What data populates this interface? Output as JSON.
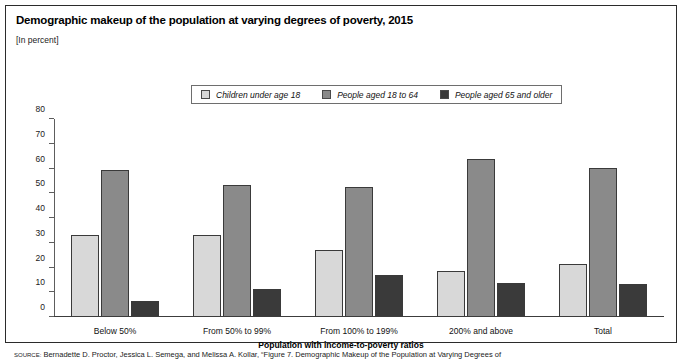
{
  "title": "Demographic makeup of the population at varying degrees of poverty, 2015",
  "units": "[In percent]",
  "source": {
    "prefix": "SOURCE:",
    "text": "Bernadette D. Proctor, Jessica L. Semega, and Melissa A. Kollar, “Figure 7. Demographic Makeup of the Population at Varying Degrees of"
  },
  "legend": [
    {
      "label": "Children under age 18",
      "color": "#d8d8d8"
    },
    {
      "label": "People aged 18 to 64",
      "color": "#8a8a8a"
    },
    {
      "label": "People aged 65 and older",
      "color": "#3a3a3a"
    }
  ],
  "chart_data": {
    "type": "bar",
    "title": "Demographic makeup of the population at varying degrees of poverty, 2015",
    "subtitle": "[In percent]",
    "xlabel": "Population with income-to-poverty ratios",
    "ylabel": "",
    "ylim": [
      0,
      80
    ],
    "yticks": [
      0,
      10,
      20,
      30,
      40,
      50,
      60,
      70,
      80
    ],
    "grid": false,
    "legend_position": "top-center",
    "categories": [
      "Below 50%",
      "From 50% to 99%",
      "From 100% to 199%",
      "200% and above",
      "Total"
    ],
    "series": [
      {
        "name": "Children under age 18",
        "color": "#d8d8d8",
        "values": [
          33.3,
          33.2,
          27.2,
          18.4,
          21.4
        ]
      },
      {
        "name": "People aged 18 to 64",
        "color": "#8a8a8a",
        "values": [
          59.5,
          53.5,
          52.5,
          64.0,
          60.3
        ]
      },
      {
        "name": "People aged 65 and older",
        "color": "#3a3a3a",
        "values": [
          6.5,
          11.3,
          17.0,
          13.8,
          13.2
        ]
      }
    ]
  }
}
